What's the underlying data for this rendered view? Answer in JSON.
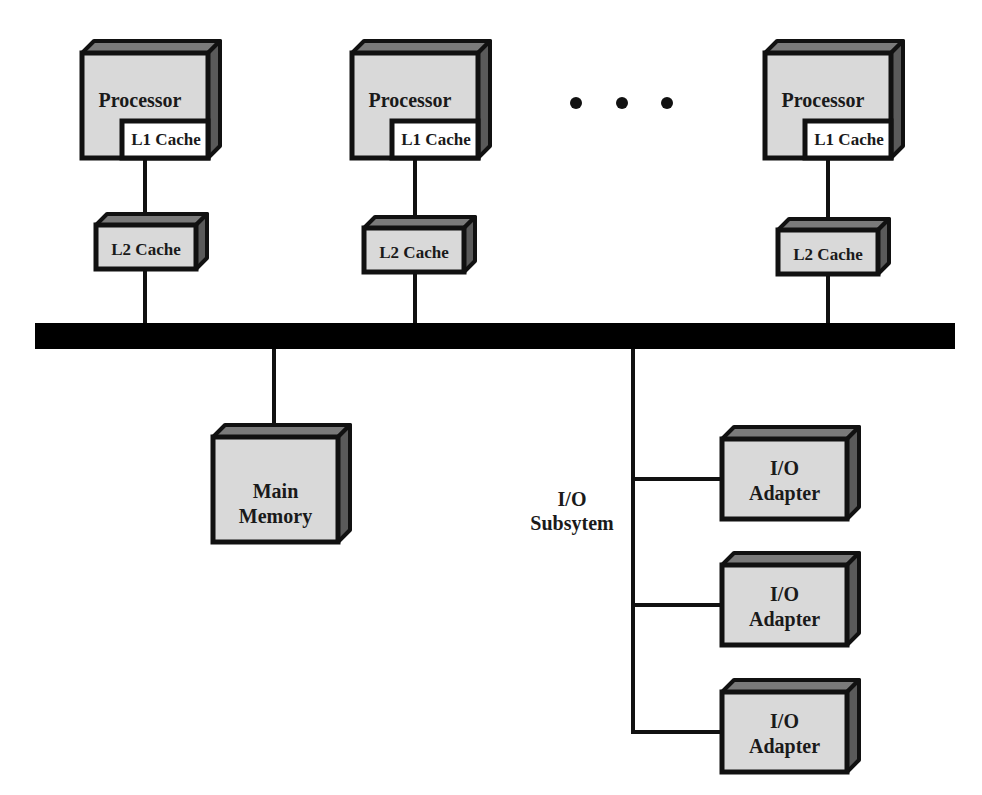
{
  "diagram": {
    "title": "",
    "colors": {
      "box_face": "#d9d9d9",
      "box_top": "#7a7a7a",
      "box_side": "#5a5a5a",
      "outline": "#111111",
      "bus": "#000000",
      "l1_face": "#ffffff"
    },
    "processors": [
      {
        "label": "Processor",
        "l1_label": "L1 Cache",
        "l2_label": "L2 Cache",
        "x": 82,
        "y": 43,
        "w": 126,
        "h": 115,
        "l2x": 96,
        "l2y": 215,
        "l2w": 100,
        "l2h": 54
      },
      {
        "label": "Processor",
        "l1_label": "L1 Cache",
        "l2_label": "L2 Cache",
        "x": 352,
        "y": 43,
        "w": 126,
        "h": 115,
        "l2x": 364,
        "l2y": 218,
        "l2w": 100,
        "l2h": 54
      },
      {
        "label": "Processor",
        "l1_label": "L1 Cache",
        "l2_label": "L2 Cache",
        "x": 765,
        "y": 43,
        "w": 126,
        "h": 115,
        "l2x": 778,
        "l2y": 220,
        "l2w": 100,
        "l2h": 54
      }
    ],
    "ellipsis": {
      "dots": 3,
      "cx": [
        576,
        622,
        667
      ],
      "cy": 103,
      "r": 6
    },
    "bus": {
      "x": 35,
      "y": 323,
      "w": 920,
      "h": 26
    },
    "main_memory": {
      "label_line1": "Main",
      "label_line2": "Memory",
      "x": 213,
      "y": 425,
      "w": 137,
      "h": 117
    },
    "io_subsystem": {
      "label_line1": "I/O",
      "label_line2": "Subsytem",
      "trunk_x": 633,
      "adapters": [
        {
          "label_line1": "I/O",
          "label_line2": "Adapter",
          "x": 722,
          "y": 427,
          "w": 137,
          "h": 92
        },
        {
          "label_line1": "I/O",
          "label_line2": "Adapter",
          "x": 722,
          "y": 553,
          "w": 137,
          "h": 92
        },
        {
          "label_line1": "I/O",
          "label_line2": "Adapter",
          "x": 722,
          "y": 680,
          "w": 137,
          "h": 92
        }
      ]
    }
  }
}
